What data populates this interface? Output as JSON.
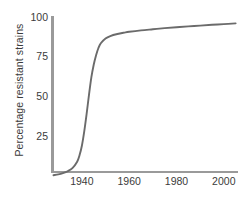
{
  "chart_data": {
    "type": "line",
    "title": "",
    "xlabel": "",
    "ylabel": "Percentage resistant strains",
    "xlim": [
      1928,
      2006
    ],
    "ylim": [
      0,
      100
    ],
    "grid": false,
    "legend": "none",
    "xticks": [
      1940,
      1960,
      1980,
      2000
    ],
    "xtick_labels": [
      "1940",
      "1960",
      "1980",
      "2000"
    ],
    "yticks": [
      25,
      50,
      75,
      100
    ],
    "ytick_labels": [
      "25",
      "50",
      "75",
      "100"
    ],
    "line_color": "#6b6b6b",
    "axis_color": "#9a9a9a",
    "text_color": "#3b3b3b",
    "series": [
      {
        "name": "Percentage resistant strains",
        "x": [
          1928,
          1930,
          1932,
          1934,
          1936,
          1938,
          1939,
          1940,
          1941,
          1942,
          1943,
          1944,
          1945,
          1946,
          1947,
          1948,
          1950,
          1952,
          1955,
          1958,
          1960,
          1965,
          1970,
          1975,
          1980,
          1985,
          1990,
          1995,
          2000,
          2005
        ],
        "y": [
          0.5,
          1.0,
          1.8,
          3.0,
          5.0,
          9.0,
          13.0,
          19.0,
          28.0,
          39.0,
          51.0,
          62.0,
          70.0,
          76.0,
          80.5,
          83.5,
          86.5,
          88.0,
          89.3,
          90.2,
          90.7,
          91.6,
          92.3,
          93.0,
          93.6,
          94.1,
          94.6,
          95.1,
          95.5,
          96.0
        ]
      }
    ]
  },
  "axis_labels": {
    "y_axis_title": "Percentage resistant strains"
  }
}
